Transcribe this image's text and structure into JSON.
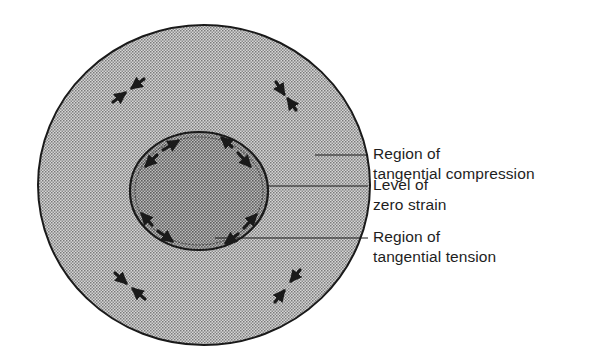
{
  "figure": {
    "type": "cross-section diagram",
    "colors": {
      "background": "#ffffff",
      "outline": "#1a1a1a",
      "outer_fill_light": "#d9d9d9",
      "outer_fill_dark": "#8a8a8a",
      "inner_fill_light": "#c4c4c4",
      "inner_fill_dark": "#6e6e6e",
      "arrow": "#1a1a1a",
      "text": "#1e1e1e"
    },
    "regions": {
      "outer": "Region of tangential compression",
      "boundary": "Level of zero strain",
      "inner": "Region of tangential tension"
    }
  },
  "labels": [
    {
      "id": "compression",
      "line1": "Region of",
      "line2": "tangential compression"
    },
    {
      "id": "zero-strain",
      "line1": "Level of",
      "line2": "zero strain"
    },
    {
      "id": "tension",
      "line1": "Region of",
      "line2": "tangential tension"
    }
  ],
  "arrows": {
    "outer_description": "four pairs of opposing arrows pointing toward each other (compression)",
    "inner_description": "four pairs of arrows pointing away from each other along the inner circle (tension)"
  }
}
